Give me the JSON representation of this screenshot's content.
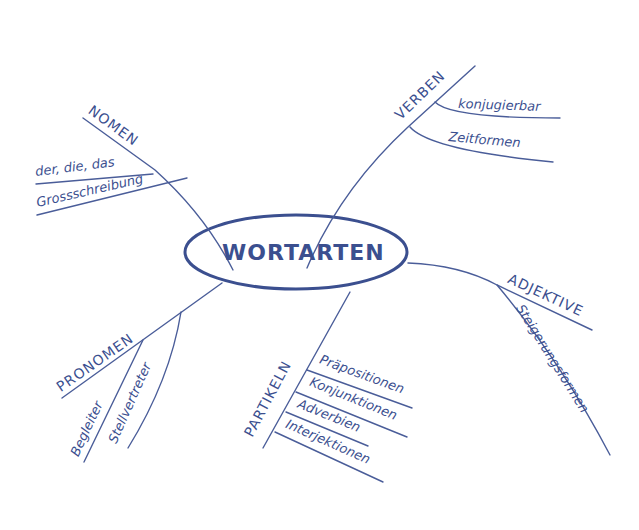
{
  "colors": {
    "ink": "#3b4f8f",
    "background": "#ffffff"
  },
  "center": {
    "label": "WORTARTEN"
  },
  "branches": {
    "nomen": {
      "label": "NOMEN",
      "items": [
        "der, die, das",
        "Grossschreibung"
      ]
    },
    "verben": {
      "label": "VERBEN",
      "items": [
        "konjugierbar",
        "Zeitformen"
      ]
    },
    "adjektive": {
      "label": "ADJEKTIVE",
      "items": [
        "Steigerungsformen"
      ]
    },
    "pronomen": {
      "label": "PRONOMEN",
      "items": [
        "Begleiter",
        "Stellvertreter"
      ]
    },
    "partikeln": {
      "label": "PARTIKELN",
      "items": [
        "Präpositionen",
        "Konjunktionen",
        "Adverbien",
        "Interjektionen"
      ]
    }
  }
}
